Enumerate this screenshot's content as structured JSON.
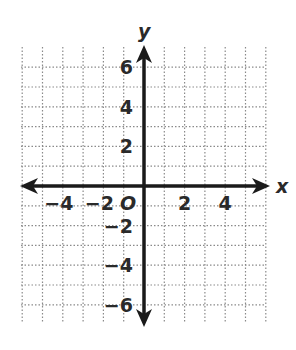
{
  "chart_data": {
    "type": "scatter",
    "title": "",
    "xlabel": "x",
    "ylabel": "y",
    "xlim": [
      -6,
      6
    ],
    "ylim": [
      -7,
      7
    ],
    "grid": true,
    "grid_style": "dotted",
    "x_ticks": [
      "-4",
      "-2",
      "2",
      "4"
    ],
    "y_ticks": [
      "6",
      "4",
      "2",
      "-2",
      "-4",
      "-6"
    ],
    "origin_label": "O",
    "series": [],
    "axis_color": "#1a1a1a",
    "grid_color": "#8a8a8a"
  }
}
